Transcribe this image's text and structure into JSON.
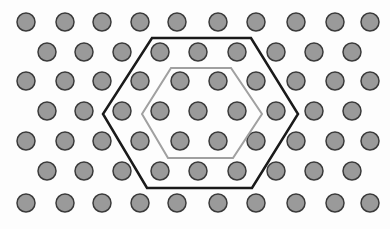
{
  "diagram": {
    "width": 390,
    "height": 229,
    "atom_color": "#9a9a9a",
    "atom_stroke": "#3a3a3a",
    "atom_radius": 9,
    "rows": [
      {
        "y": 22,
        "x": [
          26,
          65,
          102,
          140,
          177,
          218,
          256,
          296,
          335,
          370
        ]
      },
      {
        "y": 52,
        "x": [
          47,
          84,
          122,
          160,
          198,
          237,
          276,
          314,
          352
        ]
      },
      {
        "y": 81,
        "x": [
          26,
          65,
          102,
          140,
          180,
          218,
          256,
          296,
          335,
          370
        ]
      },
      {
        "y": 111,
        "x": [
          47,
          84,
          122,
          160,
          198,
          237,
          276,
          314,
          352
        ]
      },
      {
        "y": 141,
        "x": [
          26,
          65,
          102,
          140,
          180,
          218,
          256,
          296,
          335,
          370
        ]
      },
      {
        "y": 171,
        "x": [
          47,
          84,
          122,
          160,
          198,
          237,
          276,
          314,
          352
        ]
      },
      {
        "y": 203,
        "x": [
          26,
          65,
          102,
          140,
          177,
          218,
          256,
          296,
          335,
          370
        ]
      }
    ],
    "outer_hexagon": {
      "points": "152,38 251,38 298,114 252,188 147,188 103,114",
      "color": "#1a1a1a",
      "width": 2.5
    },
    "inner_hexagon": {
      "points": "171,68 231,68 262,114 233,158 168,158 142,114",
      "color": "#a0a0a0",
      "width": 2
    }
  }
}
